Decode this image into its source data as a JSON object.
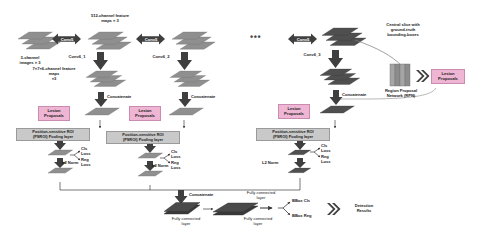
{
  "figure": {
    "type": "neural-network-architecture-diagram"
  },
  "input": {
    "label": "3-channel\nimages × 3"
  },
  "conv_arrows": [
    {
      "id": "conv5-a",
      "label": "Conv5"
    },
    {
      "id": "conv5-b",
      "label": "Conv5"
    },
    {
      "id": "conv5-c",
      "label": "Conv5"
    }
  ],
  "feature_maps": {
    "top_label": "512-channel feature\nmaps × 3",
    "pooled_label": "7×7×6-channel feature\nmaps\n×3"
  },
  "conv_stage_labels": [
    {
      "id": "conv6_1",
      "label": "Conv6_1"
    },
    {
      "id": "conv6_2",
      "label": "Conv6_2"
    },
    {
      "id": "conv6_3",
      "label": "Conv6_3"
    }
  ],
  "concat_labels": [
    {
      "id": "concat-1",
      "label": "Concatenate"
    },
    {
      "id": "concat-2",
      "label": "Concatenate"
    },
    {
      "id": "concat-3",
      "label": "Concatenate"
    },
    {
      "id": "concat-bottom",
      "label": "Concatenate"
    }
  ],
  "proposals": [
    {
      "id": "lp-1",
      "label": "Lesion\nProposals"
    },
    {
      "id": "lp-2",
      "label": "Lesion\nProposals"
    },
    {
      "id": "lp-3",
      "label": "Lesion\nProposals"
    },
    {
      "id": "lp-rpn",
      "label": "Lesion\nProposals"
    }
  ],
  "psroi_blocks": [
    {
      "id": "psroi-1",
      "label": "Position-sensitive ROI\n(PSROI) Pooling layer"
    },
    {
      "id": "psroi-2",
      "label": "Position-sensitive ROI\n(PSROI) Pooling layer"
    },
    {
      "id": "psroi-3",
      "label": "Position-sensitive ROI\n(PSROI) Pooling layer"
    }
  ],
  "l2norm_labels": [
    {
      "id": "l2-1",
      "label": "L2 Norm"
    },
    {
      "id": "l2-2",
      "label": "L2 Norm"
    },
    {
      "id": "l2-3",
      "label": "L2 Norm"
    }
  ],
  "losses": [
    {
      "id": "loss-1",
      "cls": "Cls\nLoss",
      "reg": "Reg\nLoss"
    },
    {
      "id": "loss-2",
      "cls": "Cls\nLoss",
      "reg": "Reg\nLoss"
    },
    {
      "id": "loss-3",
      "cls": "Cls\nLoss",
      "reg": "Reg\nLoss"
    }
  ],
  "rpn": {
    "central_slice_label": "Central slice with\nground-truth\nbounding-boxes",
    "network_label": "Region Proposal\nNetwork (RPN)"
  },
  "bottom": {
    "fc_left": "Fully connected\nlayer",
    "fc_mid_upper": "Fully connected\nlayer",
    "fc_mid_lower": "Fully connected\nlayer",
    "fc_right": "Fully connected\nlayer",
    "bbox_cls": "BBox Cls",
    "bbox_reg": "BBox Reg",
    "detection_results": "Detection\nResults"
  },
  "ellipsis": "•••",
  "colors": {
    "slab_gray": "#8f8f8f",
    "slab_dark": "#5c5c5c",
    "proposal_pink": "#efb6d4",
    "rpn_fill": "#9a9a9a",
    "arrow_dark": "#3a3a3a",
    "text": "#1a1a1a"
  }
}
